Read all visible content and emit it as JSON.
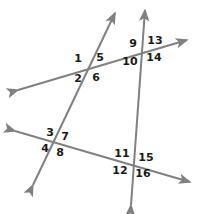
{
  "figure": {
    "type": "geometry-diagram",
    "width": 198,
    "height": 214,
    "background_color": "#ffffff",
    "line_color": "#808080",
    "label_color": "#1a1a1a",
    "line_width": 2
  },
  "lines": [
    {
      "name": "upper-transversal",
      "x1": 18,
      "y1": 90,
      "x2": 187,
      "y2": 40,
      "arrow_start": true,
      "arrow_end": true
    },
    {
      "name": "lower-transversal",
      "x1": 15,
      "y1": 131,
      "x2": 190,
      "y2": 182,
      "arrow_start": true,
      "arrow_end": true
    },
    {
      "name": "left-slanted-line",
      "x1": 33,
      "y1": 185,
      "x2": 115,
      "y2": 13,
      "arrow_start": true,
      "arrow_end": true
    },
    {
      "name": "right-vertical-line",
      "x1": 131,
      "y1": 205,
      "x2": 145,
      "y2": 10,
      "arrow_start": true,
      "arrow_end": true
    }
  ],
  "intersections": [
    {
      "name": "upper-left-intersection",
      "x": 88,
      "y": 68
    },
    {
      "name": "upper-right-intersection",
      "x": 140,
      "y": 48
    },
    {
      "name": "lower-left-intersection",
      "x": 55,
      "y": 141
    },
    {
      "name": "lower-right-intersection",
      "x": 131,
      "y": 160
    }
  ],
  "angle_labels": [
    {
      "id": "1",
      "text": "1",
      "x": 78,
      "y": 58,
      "intersection": "upper-left-intersection"
    },
    {
      "id": "2",
      "text": "2",
      "x": 78,
      "y": 78,
      "intersection": "upper-left-intersection"
    },
    {
      "id": "5",
      "text": "5",
      "x": 100,
      "y": 57,
      "intersection": "upper-left-intersection"
    },
    {
      "id": "6",
      "text": "6",
      "x": 96,
      "y": 77,
      "intersection": "upper-left-intersection"
    },
    {
      "id": "9",
      "text": "9",
      "x": 133,
      "y": 43,
      "intersection": "upper-right-intersection"
    },
    {
      "id": "10",
      "text": "10",
      "x": 130,
      "y": 61,
      "intersection": "upper-right-intersection"
    },
    {
      "id": "13",
      "text": "13",
      "x": 155,
      "y": 40,
      "intersection": "upper-right-intersection"
    },
    {
      "id": "14",
      "text": "14",
      "x": 154,
      "y": 57,
      "intersection": "upper-right-intersection"
    },
    {
      "id": "3",
      "text": "3",
      "x": 50,
      "y": 132,
      "intersection": "lower-left-intersection"
    },
    {
      "id": "4",
      "text": "4",
      "x": 45,
      "y": 148,
      "intersection": "lower-left-intersection"
    },
    {
      "id": "7",
      "text": "7",
      "x": 65,
      "y": 136,
      "intersection": "lower-left-intersection"
    },
    {
      "id": "8",
      "text": "8",
      "x": 60,
      "y": 152,
      "intersection": "lower-left-intersection"
    },
    {
      "id": "11",
      "text": "11",
      "x": 122,
      "y": 153,
      "intersection": "lower-right-intersection"
    },
    {
      "id": "12",
      "text": "12",
      "x": 120,
      "y": 170,
      "intersection": "lower-right-intersection"
    },
    {
      "id": "15",
      "text": "15",
      "x": 146,
      "y": 157,
      "intersection": "lower-right-intersection"
    },
    {
      "id": "16",
      "text": "16",
      "x": 143,
      "y": 173,
      "intersection": "lower-right-intersection"
    }
  ]
}
